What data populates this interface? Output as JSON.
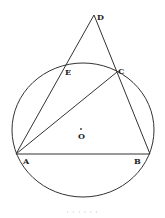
{
  "diagram": {
    "type": "geometry",
    "colors": {
      "stroke": "#333333",
      "background": "#ffffff",
      "text": "#222222"
    },
    "circle": {
      "center_label": "O",
      "cx": 83,
      "cy": 130,
      "rx": 71,
      "ry": 67
    },
    "points": {
      "A": {
        "label": "A",
        "x": 16,
        "y": 154
      },
      "B": {
        "label": "B",
        "x": 150,
        "y": 154
      },
      "C": {
        "label": "C",
        "x": 117,
        "y": 72
      },
      "D": {
        "label": "D",
        "x": 94,
        "y": 15
      },
      "E": {
        "label": "E",
        "x": 65,
        "y": 66
      },
      "O": {
        "label": "O",
        "x": 81,
        "y": 130
      }
    },
    "segments": [
      {
        "from": "A",
        "to": "B"
      },
      {
        "from": "A",
        "to": "D"
      },
      {
        "from": "B",
        "to": "D"
      },
      {
        "from": "A",
        "to": "C"
      }
    ]
  },
  "caption": "· · · · · ·"
}
